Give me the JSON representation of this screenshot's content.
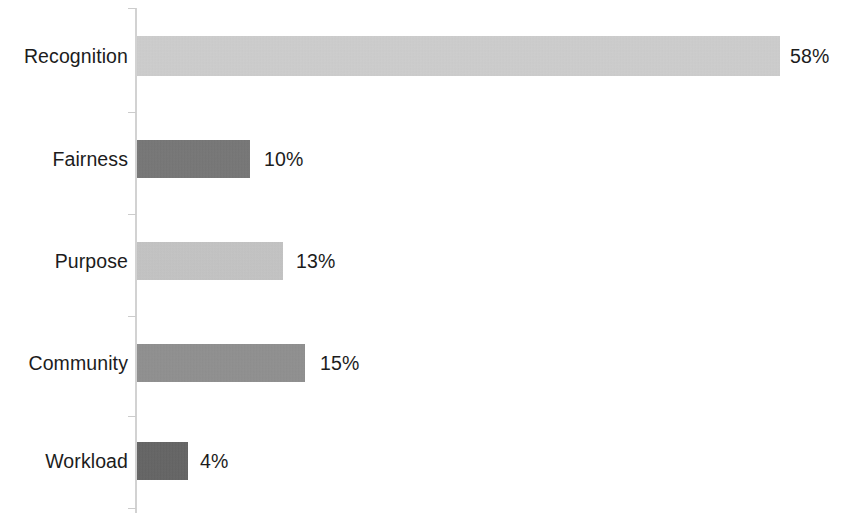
{
  "chart_data": {
    "type": "bar",
    "orientation": "horizontal",
    "title": "",
    "subtitle": "",
    "xlabel": "",
    "ylabel": "",
    "grid": false,
    "legend": "none",
    "axis_line_color": "#d2d2d2",
    "background_color": "#ffffff",
    "text_color": "#1c1c1c",
    "xlim": [
      0,
      58
    ],
    "categories": [
      "Recognition",
      "Fairness",
      "Purpose",
      "Community",
      "Workload"
    ],
    "values": [
      58,
      10,
      13,
      15,
      4
    ],
    "value_labels": [
      "58%",
      "10%",
      "13%",
      "15%",
      "4%"
    ],
    "bar_colors": [
      "#cfcfcf",
      "#6e6e6e",
      "#c4c4c4",
      "#8a8a8a",
      "#5a5a5a"
    ],
    "bars": [
      {
        "category": "Recognition",
        "value": 58,
        "value_label": "58%",
        "color": "#cfcfcf",
        "pixel_top": 36,
        "pixel_height": 40,
        "pixel_width": 643,
        "label_x": 790
      },
      {
        "category": "Fairness",
        "value": 10,
        "value_label": "10%",
        "color": "#6e6e6e",
        "pixel_top": 140,
        "pixel_height": 38,
        "pixel_width": 113,
        "label_x": 264
      },
      {
        "category": "Purpose",
        "value": 13,
        "value_label": "13%",
        "color": "#c4c4c4",
        "pixel_top": 242,
        "pixel_height": 38,
        "pixel_width": 146,
        "label_x": 296
      },
      {
        "category": "Community",
        "value": 15,
        "value_label": "15%",
        "color": "#8a8a8a",
        "pixel_top": 344,
        "pixel_height": 38,
        "pixel_width": 168,
        "label_x": 320
      },
      {
        "category": "Workload",
        "value": 4,
        "value_label": "4%",
        "color": "#5a5a5a",
        "pixel_top": 442,
        "pixel_height": 38,
        "pixel_width": 51,
        "label_x": 200
      }
    ],
    "axis_ticks_y": [
      8,
      112,
      214,
      316,
      416,
      508
    ]
  }
}
